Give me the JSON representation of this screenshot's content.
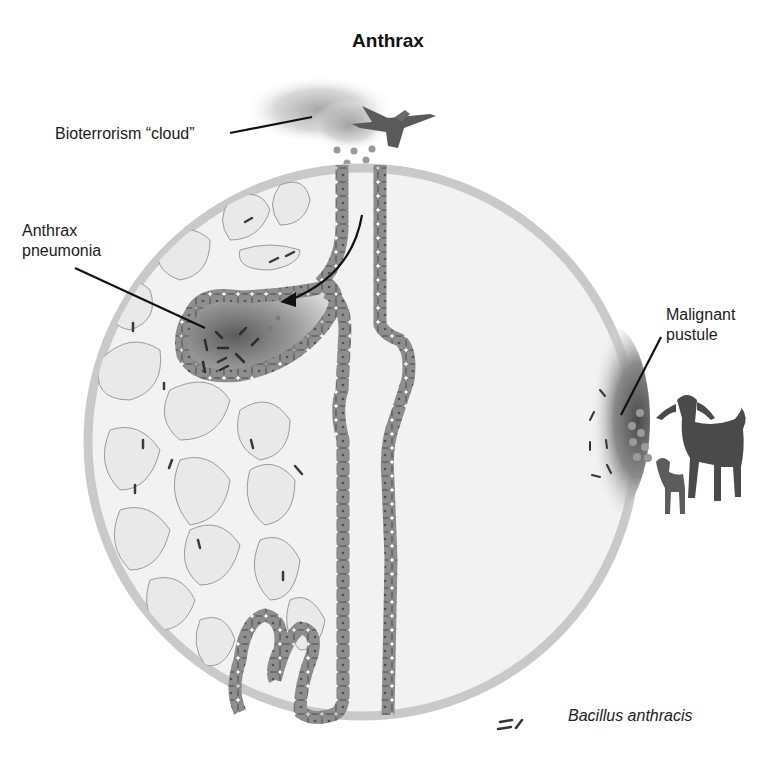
{
  "title": "Anthrax",
  "labels": {
    "cloud": "Bioterrorism “cloud”",
    "pneumonia_line1": "Anthrax",
    "pneumonia_line2": "pneumonia",
    "pustule_line1": "Malignant",
    "pustule_line2": "pustule"
  },
  "legend": {
    "symbol": "bacillus-rods",
    "text": "Bacillus anthracis"
  },
  "colors": {
    "circle_rim": "#c8c8c8",
    "tissue_fill": "#efefef",
    "cell": "#8c8c8c",
    "cell_border": "#6e6e6e",
    "infection_dark": "#5a5a5a",
    "bacillus": "#3a3a3a",
    "spore": "#9a9a9a",
    "goat": "#4a4a4a"
  }
}
